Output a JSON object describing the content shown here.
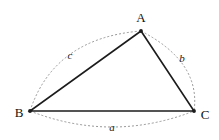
{
  "figure": {
    "background_color": "#ffffff",
    "width": 219,
    "height": 140,
    "line_color": "#1c1c1c",
    "arc_color": "#8c8c8c",
    "label_color": "#111111"
  },
  "vertices": [
    {
      "id": "A",
      "label": "A",
      "x": 141,
      "y": 31,
      "label_x": 141,
      "label_y": 22
    },
    {
      "id": "B",
      "label": "B",
      "x": 30,
      "y": 111,
      "label_x": 19,
      "label_y": 117
    },
    {
      "id": "C",
      "label": "C",
      "x": 194,
      "y": 111,
      "label_x": 205,
      "label_y": 119
    }
  ],
  "sides": [
    {
      "id": "a",
      "label": "a",
      "from": "B",
      "to": "C",
      "label_x": 112,
      "label_y": 131
    },
    {
      "id": "b",
      "label": "b",
      "from": "A",
      "to": "C",
      "label_x": 182,
      "label_y": 62
    },
    {
      "id": "c",
      "label": "c",
      "from": "B",
      "to": "A",
      "label_x": 70,
      "label_y": 59
    }
  ],
  "paths": {
    "triangle": "M 141 31 L 30 111 L 194 111 Z",
    "arc_c": "M 30 111 Q 54 38 141 31",
    "arc_b": "M 141 31 Q 201 62 194 111",
    "arc_a": "M 30 111 Q 112 143 194 111"
  }
}
